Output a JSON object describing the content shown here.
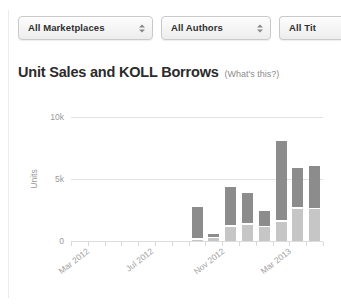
{
  "filters": [
    {
      "label": "All Marketplaces",
      "name": "marketplace-filter"
    },
    {
      "label": "All Authors",
      "name": "author-filter"
    },
    {
      "label": "All Tit",
      "name": "title-filter"
    }
  ],
  "heading": {
    "title": "Unit Sales and KOLL Borrows",
    "note": "(What's this?)"
  },
  "colors": {
    "borrows": "#8c8c8c",
    "sales": "#c6c6c6",
    "grid": "#e3e3e3",
    "axis_text": "#9a9a9a"
  },
  "chart_data": {
    "type": "bar",
    "title": "Unit Sales and KOLL Borrows",
    "xlabel": "",
    "ylabel": "Units",
    "ylim": [
      0,
      10000
    ],
    "yticks": [
      0,
      5000,
      10000
    ],
    "ytick_labels": [
      "0",
      "5k",
      "10k"
    ],
    "grid": true,
    "stacked": true,
    "legend_position": "none",
    "x_tick_labels": [
      "Mar 2012",
      "Jul 2012",
      "Nov 2012",
      "Mar 2013"
    ],
    "x_tick_indices": [
      0,
      4,
      8,
      12
    ],
    "categories": [
      "Mar 2012",
      "Apr 2012",
      "May 2012",
      "Jun 2012",
      "Jul 2012",
      "Aug 2012",
      "Sep 2012",
      "Oct 2012",
      "Nov 2012",
      "Dec 2012",
      "Jan 2013",
      "Feb 2013",
      "Mar 2013",
      "Apr 2013",
      "May 2013"
    ],
    "series": [
      {
        "name": "Unit Sales",
        "color": "#c6c6c6",
        "values": [
          0,
          0,
          0,
          0,
          0,
          0,
          0,
          120,
          230,
          1150,
          1300,
          1100,
          1550,
          2600,
          2550
        ]
      },
      {
        "name": "KOLL Borrows",
        "color": "#8c8c8c",
        "values": [
          0,
          0,
          0,
          0,
          0,
          0,
          0,
          2480,
          250,
          3050,
          2450,
          1200,
          6400,
          3200,
          3400
        ]
      }
    ]
  }
}
